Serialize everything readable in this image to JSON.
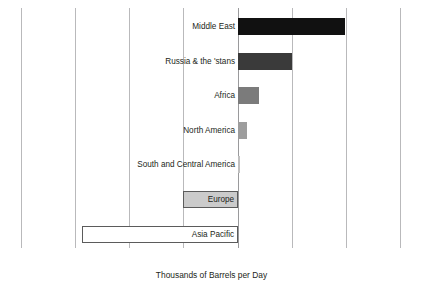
{
  "chart_data": {
    "type": "bar",
    "orientation": "horizontal",
    "title": "",
    "xlabel": "Thousands of Barrels per Day",
    "ylabel": "",
    "xlim": [
      -40000,
      30000
    ],
    "xticks": [
      -40000,
      -30000,
      -20000,
      -10000,
      0,
      10000,
      20000,
      30000
    ],
    "xtick_labels": [
      "–40,000",
      "–30,000",
      "–20,000",
      "–10,000",
      "0",
      "10,000",
      "20,000",
      "30,000"
    ],
    "grid": "vertical",
    "legend": "none",
    "categories": [
      "Middle East",
      "Russia & the 'stans",
      "Africa",
      "North America",
      "South and Central America",
      "Europe",
      "Asia Pacific"
    ],
    "values": [
      19800,
      9900,
      3900,
      1700,
      400,
      -10200,
      -28900
    ],
    "bars": [
      {
        "category": "Middle East",
        "value": 19800,
        "fill": "#111111",
        "stroke": "#111111",
        "label_position": "outside-left"
      },
      {
        "category": "Russia & the 'stans",
        "value": 9900,
        "fill": "#3a3a3a",
        "stroke": "#3a3a3a",
        "label_position": "outside-left"
      },
      {
        "category": "Africa",
        "value": 3900,
        "fill": "#7b7b7b",
        "stroke": "#7b7b7b",
        "label_position": "outside-left"
      },
      {
        "category": "North America",
        "value": 1700,
        "fill": "#9d9d9d",
        "stroke": "#9d9d9d",
        "label_position": "outside-left"
      },
      {
        "category": "South and Central America",
        "value": 400,
        "fill": "#c0c0c0",
        "stroke": "#c0c0c0",
        "label_position": "outside-left"
      },
      {
        "category": "Europe",
        "value": -10200,
        "fill": "#cbcbcb",
        "stroke": "#5b5b5b",
        "label_position": "inside-right"
      },
      {
        "category": "Asia Pacific",
        "value": -28900,
        "fill": "#ffffff",
        "stroke": "#5b5b5b",
        "label_position": "inside-right"
      }
    ]
  },
  "axis": {
    "title": "Thousands of Barrels per Day"
  },
  "colors": {
    "background": "#ffffff",
    "gridline": "#b9b9bb",
    "zero_line": "#9a9a9c",
    "text": "#231f20"
  }
}
